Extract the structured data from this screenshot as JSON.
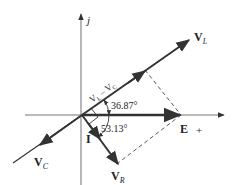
{
  "diagram": {
    "type": "phasor-diagram",
    "axes": {
      "imag_label": "j",
      "real_label": "+"
    },
    "phasors": [
      {
        "name": "V_L",
        "label_main": "V",
        "label_sub": "L",
        "angle_deg": 36.87,
        "style": "solid-arrow"
      },
      {
        "name": "V_C",
        "label_main": "V",
        "label_sub": "C",
        "angle_deg": 216.87,
        "style": "solid-arrow"
      },
      {
        "name": "E",
        "label_main": "E",
        "label_sub": "",
        "angle_deg": 0,
        "style": "thick-arrow"
      },
      {
        "name": "V_R",
        "label_main": "V",
        "label_sub": "R",
        "angle_deg": -53.13,
        "style": "solid-arrow"
      },
      {
        "name": "I",
        "label_main": "I",
        "label_sub": "",
        "angle_deg": -53.13,
        "style": "arrow-on-line"
      }
    ],
    "difference_label": "V",
    "difference_label_parts": [
      "V",
      "L",
      " – V",
      "C"
    ],
    "angles": {
      "upper": "36.87°",
      "lower": "53.13°"
    },
    "construction": "dashed parallelogram completing E = V_R + (V_L – V_C)",
    "colors": {
      "line": "#333333",
      "axis": "#777777",
      "dash": "#444444"
    }
  }
}
